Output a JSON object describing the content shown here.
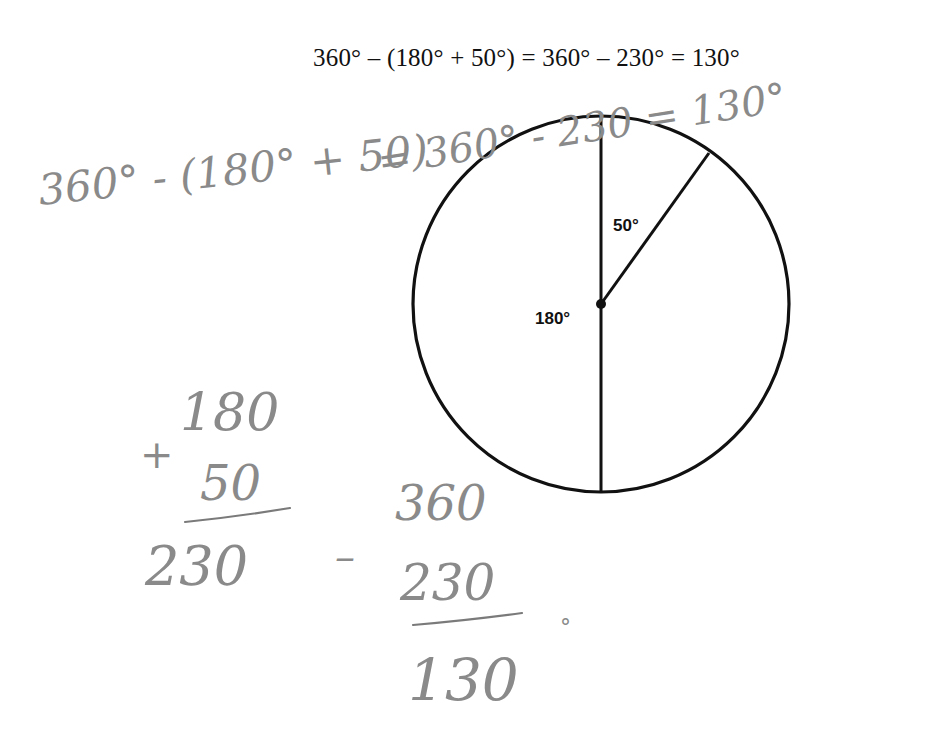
{
  "typed_equation": "360° – (180° + 50°) = 360° – 230° = 130°",
  "diagram": {
    "type": "circle-with-angles",
    "center": [
      601,
      304
    ],
    "radius": 188,
    "angles": [
      {
        "label": "180°",
        "description": "left semicircle"
      },
      {
        "label": "50°",
        "description": "angle between vertical radius and slanted radius"
      }
    ],
    "unknown_angle_result": "130°"
  },
  "handwriting": {
    "top_equation": {
      "part1": "360° - (180° + 50)",
      "part2": "= 360° - 230 = 130°"
    },
    "addition": {
      "operator": "+",
      "addend1": "180",
      "addend2": "50",
      "sum": "230"
    },
    "subtraction": {
      "operator": "–",
      "minuend": "360",
      "subtrahend": "230",
      "difference": "130",
      "degree_mark": "°"
    }
  }
}
